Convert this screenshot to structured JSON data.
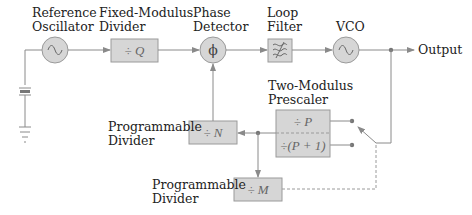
{
  "colors": {
    "block_fill": "#d6d6d6",
    "block_stroke": "#9a9a9a",
    "line": "#8a8a8a",
    "text": "#222222"
  },
  "labels": {
    "reference_oscillator": [
      "Reference",
      "Oscillator"
    ],
    "fixed_modulus_divider": [
      "Fixed-Modulus",
      "Divider"
    ],
    "phase_detector": [
      "Phase",
      "Detector"
    ],
    "loop_filter": [
      "Loop",
      "Filter"
    ],
    "vco": "VCO",
    "output": "Output",
    "two_modulus_prescaler": [
      "Two-Modulus",
      "Prescaler"
    ],
    "programmable_divider_n": [
      "Programmable",
      "Divider"
    ],
    "programmable_divider_m": [
      "Programmable",
      "Divider"
    ]
  },
  "blocks": {
    "divide_q": "÷ Q",
    "phase_symbol": "ϕ",
    "divide_p": "÷ P",
    "divide_p_plus_1": "÷(P + 1)",
    "divide_n": "÷ N",
    "divide_m": "÷ M"
  },
  "icons": {
    "reference_oscillator": "sine-source-icon",
    "crystal": "crystal-icon",
    "ground": "ground-icon",
    "loop_filter": "lowpass-filter-icon",
    "vco": "sine-source-icon",
    "switch": "switch-icon"
  }
}
